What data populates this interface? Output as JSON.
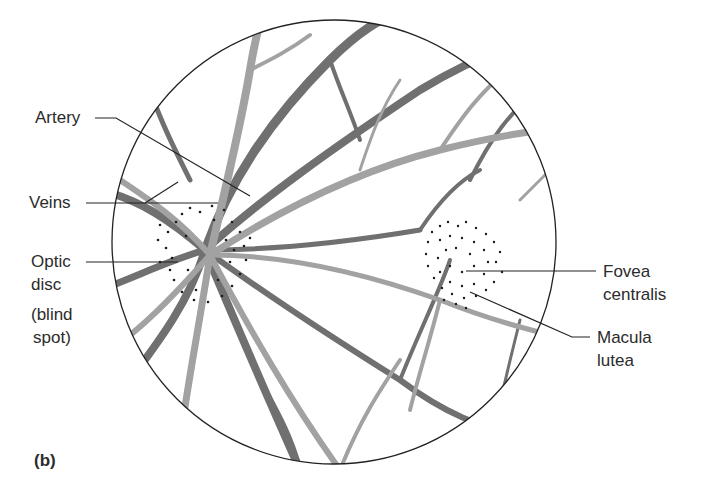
{
  "figure": {
    "panel_label": "(b)",
    "colors": {
      "artery": "#9a9a9a",
      "vein": "#6e6e6e",
      "outline": "#222222",
      "leader_line": "#222222"
    }
  },
  "labels": {
    "artery": "Artery",
    "veins": "Veins",
    "optic_disc_line1": "Optic",
    "optic_disc_line2": "disc",
    "blind_spot_line1": "(blind",
    "blind_spot_line2": "spot)",
    "fovea_line1": "Fovea",
    "fovea_line2": "centralis",
    "macula_line1": "Macula",
    "macula_line2": "lutea"
  }
}
